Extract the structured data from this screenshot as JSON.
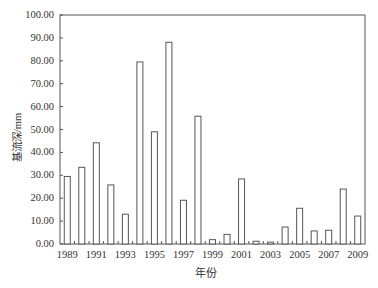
{
  "chart_data": {
    "type": "bar",
    "title": "",
    "xlabel": "年份",
    "ylabel": "基流深/mm",
    "ylim": [
      0,
      100
    ],
    "yticks": [
      "0.00",
      "10.00",
      "20.00",
      "30.00",
      "40.00",
      "50.00",
      "60.00",
      "70.00",
      "80.00",
      "90.00",
      "100.00"
    ],
    "xtick_labels": [
      "1989",
      "1991",
      "1993",
      "1995",
      "1997",
      "1999",
      "2001",
      "2003",
      "2005",
      "2007",
      "2009"
    ],
    "categories": [
      "1989",
      "1990",
      "1991",
      "1992",
      "1993",
      "1994",
      "1995",
      "1996",
      "1997",
      "1998",
      "1999",
      "2000",
      "2001",
      "2002",
      "2003",
      "2004",
      "2005",
      "2006",
      "2007",
      "2008",
      "2009"
    ],
    "values": [
      29.5,
      33.5,
      44.2,
      25.8,
      13.0,
      79.5,
      49.0,
      88.1,
      19.1,
      55.8,
      1.9,
      4.2,
      28.4,
      1.2,
      0.8,
      7.4,
      15.6,
      5.7,
      6.0,
      24.0,
      12.2
    ],
    "grid": false,
    "legend": null,
    "bar_style": {
      "fill": "#ffffff",
      "stroke": "#555555"
    }
  }
}
